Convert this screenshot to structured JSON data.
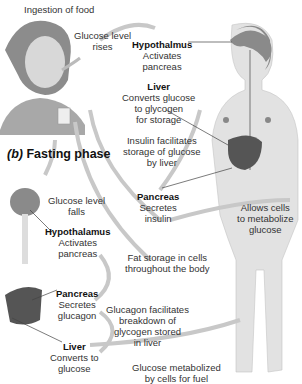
{
  "diagram": {
    "top_caption": "Ingestion of food",
    "fasting_heading_prefix": "(b)",
    "fasting_heading": "Fasting phase",
    "fed_phase": {
      "glucose_rises": [
        "Glucose level",
        "rises"
      ],
      "hypothalamus": {
        "title": "Hypothalmus",
        "lines": [
          "Activates",
          "pancreas"
        ]
      },
      "liver": {
        "title": "Liver",
        "lines": [
          "Converts glucose",
          "to glycogen",
          "for storage"
        ]
      },
      "insulin_note": [
        "Insulin facilitates",
        "storage of glucose",
        "by liver"
      ],
      "pancreas": {
        "title": "Pancreas",
        "lines": [
          "Secretes",
          "insulin"
        ]
      },
      "cells_note": [
        "Allows cells",
        "to metabolize",
        "glucose"
      ],
      "fat_storage": [
        "Fat storage in cells",
        "throughout the body"
      ]
    },
    "fasting_phase": {
      "glucose_falls": [
        "Glucose level",
        "falls"
      ],
      "hypothalamus": {
        "title": "Hypothalamus",
        "lines": [
          "Activates",
          "pancreas"
        ]
      },
      "pancreas": {
        "title": "Pancreas",
        "lines": [
          "Secretes",
          "glucagon"
        ]
      },
      "glucagon_note": [
        "Glucagon facilitates",
        "breakdown of",
        "glycogen stored",
        "in liver"
      ],
      "liver": {
        "title": "Liver",
        "lines": [
          "Converts to",
          "glucose"
        ]
      },
      "glucose_metabolized": [
        "Glucose metabolized",
        "by cells for fuel"
      ]
    },
    "colors": {
      "arrow": "#c8c8c8",
      "body": "#e2e2e2",
      "liver": "#555555",
      "brain": "#8a8a8a"
    }
  }
}
